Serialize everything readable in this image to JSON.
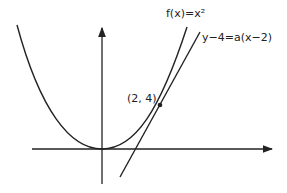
{
  "labels": {
    "function": "f(x)=x²",
    "tangent": "y−4=a(x−2)",
    "point": "(2, 4)"
  },
  "colors": {
    "stroke": "#222222",
    "background": "#ffffff"
  },
  "geometry": {
    "parabola": "y = x^2",
    "tangent_point": [
      2,
      4
    ],
    "tangent_line": "y - 4 = a(x - 2)"
  }
}
